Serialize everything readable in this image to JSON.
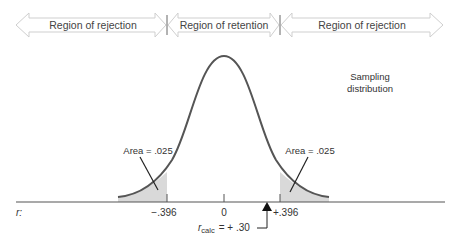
{
  "regions": [
    {
      "label": "Region of rejection",
      "x1": 4,
      "x2": 167
    },
    {
      "label": "Region of retention",
      "x1": 167,
      "x2": 280
    },
    {
      "label": "Region of rejection",
      "x1": 280,
      "x2": 448
    }
  ],
  "curve_label": {
    "line1": "Sampling",
    "line2": "distribution"
  },
  "area_labels": {
    "left": "Area = .025",
    "right": "Area = .025"
  },
  "axis": {
    "variable": "r:",
    "ticks": [
      {
        "label": "−.396",
        "x": 167
      },
      {
        "label": "0",
        "x": 224
      },
      {
        "label": "+.396",
        "x": 280
      }
    ]
  },
  "r_calc": {
    "symbol": "r",
    "subscript": "calc",
    "value": "= + .30",
    "x": 267
  },
  "colors": {
    "curve": "#555555",
    "shade": "#d9d9d9",
    "axis": "#555555",
    "region_arrow": "#cfcfcf"
  }
}
